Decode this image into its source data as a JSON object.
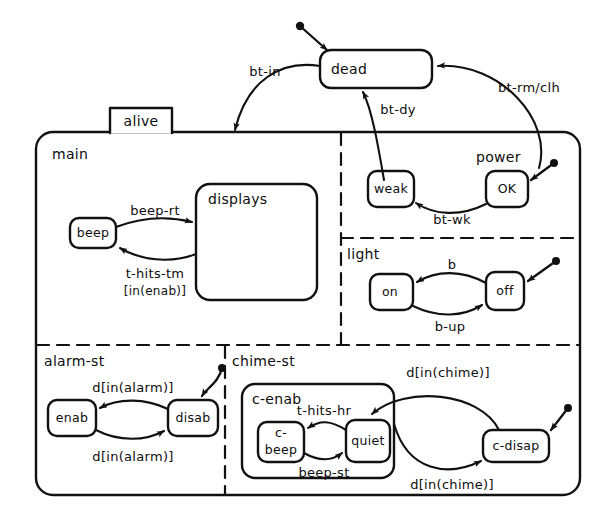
{
  "diagram": {
    "type": "statechart",
    "title": "alive",
    "top_state": {
      "name": "dead"
    },
    "root_box": {
      "label": "alive"
    },
    "regions": [
      {
        "name": "main"
      },
      {
        "name": "power"
      },
      {
        "name": "light"
      },
      {
        "name": "alarm-st"
      },
      {
        "name": "chime-st"
      }
    ],
    "states": [
      {
        "id": "dead",
        "label": "dead"
      },
      {
        "id": "beep",
        "label": "beep"
      },
      {
        "id": "displays",
        "label": "displays"
      },
      {
        "id": "weak",
        "label": "weak"
      },
      {
        "id": "ok",
        "label": "OK"
      },
      {
        "id": "on",
        "label": "on"
      },
      {
        "id": "off",
        "label": "off"
      },
      {
        "id": "enab",
        "label": "enab"
      },
      {
        "id": "disab",
        "label": "disab"
      },
      {
        "id": "c-enab",
        "label": "c-enab"
      },
      {
        "id": "c-beep",
        "label": "c-",
        "label2": "beep"
      },
      {
        "id": "quiet",
        "label": "quiet"
      },
      {
        "id": "c-disap",
        "label": "c-disap"
      }
    ],
    "transitions": [
      {
        "from": "dead",
        "to": "alive",
        "label": "bt-in"
      },
      {
        "from": "alive",
        "to": "dead",
        "label": "bt-dy"
      },
      {
        "from": "dead",
        "to": "alive",
        "label": "bt-rm/clh"
      },
      {
        "from": "ok",
        "to": "weak",
        "label": "bt-wk"
      },
      {
        "from": "beep",
        "to": "displays",
        "label": "beep-rt"
      },
      {
        "from": "displays",
        "to": "beep",
        "label": "t-hits-tm",
        "label2": "[in(enab)]"
      },
      {
        "from": "off",
        "to": "on",
        "label": "b"
      },
      {
        "from": "on",
        "to": "off",
        "label": "b-up"
      },
      {
        "from": "disab",
        "to": "enab",
        "label": "d[in(alarm)]"
      },
      {
        "from": "enab",
        "to": "disab",
        "label": "d[in(alarm)]"
      },
      {
        "from": "quiet",
        "to": "c-beep",
        "label": "t-hits-hr"
      },
      {
        "from": "c-beep",
        "to": "quiet",
        "label": "beep-st"
      },
      {
        "from": "c-disap",
        "to": "quiet",
        "label": "d[in(chime)]"
      },
      {
        "from": "c-enab",
        "to": "c-disap",
        "label": "d[in(chime)]"
      }
    ],
    "default_entries": [
      {
        "target": "dead"
      },
      {
        "target": "ok"
      },
      {
        "target": "off"
      },
      {
        "target": "disab"
      },
      {
        "target": "c-disap"
      }
    ],
    "colors": {
      "stroke": "#111111",
      "background": "#ffffff"
    }
  }
}
